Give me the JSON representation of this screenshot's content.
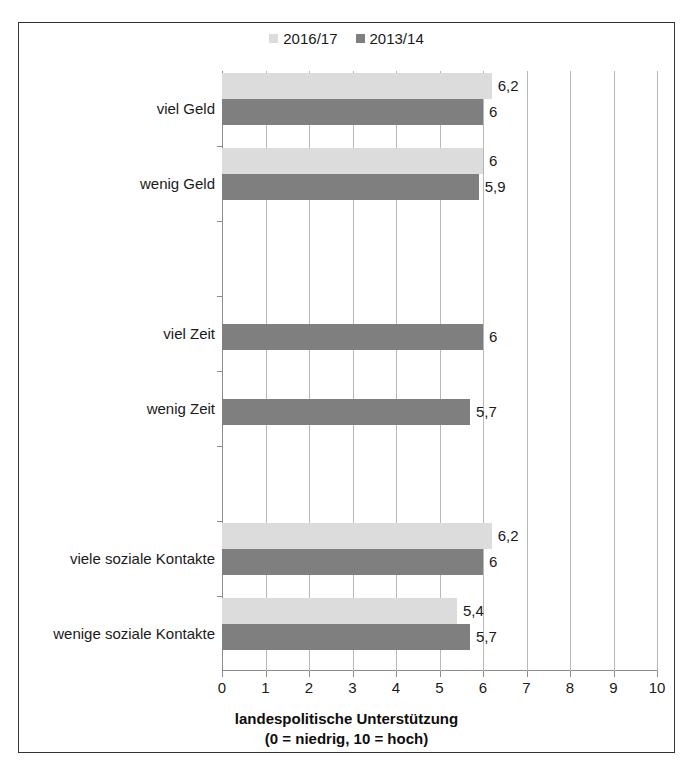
{
  "chart_data": {
    "type": "bar",
    "orientation": "horizontal",
    "title": "",
    "xlabel_lines": [
      "landespolitische Unterstützung",
      "(0 = niedrig, 10 = hoch)"
    ],
    "ylabel": "",
    "xlim": [
      0,
      10
    ],
    "xticks": [
      0,
      1,
      2,
      3,
      4,
      5,
      6,
      7,
      8,
      9,
      10
    ],
    "xtick_labels": [
      "0",
      "1",
      "2",
      "3",
      "4",
      "5",
      "6",
      "7",
      "8",
      "9",
      "10"
    ],
    "grid": true,
    "grid_axis": "x",
    "legend_position": "top-center",
    "legend": [
      "2016/17",
      "2013/14"
    ],
    "categories": [
      "viel Geld",
      "wenig Geld",
      "",
      "viel Zeit",
      "wenig Zeit",
      "",
      "viele soziale Kontakte",
      "wenige soziale Kontakte"
    ],
    "series": [
      {
        "name": "2016/17",
        "color": "#dcdcdc",
        "values": [
          6.2,
          6.0,
          null,
          null,
          null,
          null,
          6.2,
          5.4
        ],
        "labels": [
          "6,2",
          "6",
          "",
          "",
          "",
          "",
          "6,2",
          "5,4"
        ]
      },
      {
        "name": "2013/14",
        "color": "#7f7f7f",
        "values": [
          6.0,
          5.9,
          null,
          6.0,
          5.7,
          null,
          6.0,
          5.7
        ],
        "labels": [
          "6",
          "5,9",
          "",
          "6",
          "5,7",
          "",
          "6",
          "5,7"
        ]
      }
    ]
  },
  "colors": {
    "series_2016_17": "#dcdcdc",
    "series_2013_14": "#7f7f7f",
    "gridline": "#b8b8b8",
    "axis": "#8c8c8c",
    "frame": "#333333",
    "text": "#1a1a1a"
  }
}
